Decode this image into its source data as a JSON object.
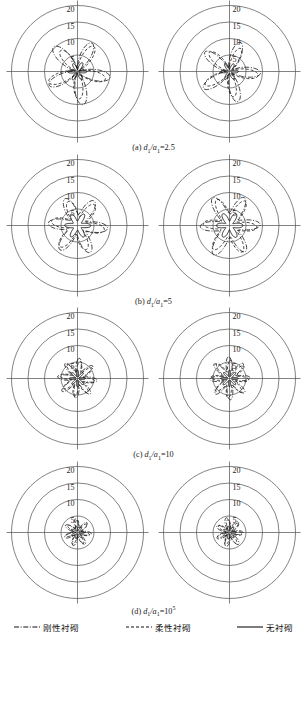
{
  "figure": {
    "title": "",
    "panel_count": 4,
    "plots_per_panel": 2,
    "grid_color": "#4d4d4d",
    "curve_color": "#111111"
  },
  "axis": {
    "tick_labels": [
      "5",
      "10",
      "15",
      "20"
    ],
    "tick_values": [
      5,
      10,
      15,
      20
    ],
    "rmax": 20,
    "rings": 4,
    "cross_axes": true
  },
  "legend": {
    "items": [
      {
        "label": "刚性衬砌",
        "style": "dash-dot",
        "name": "rigid-lining"
      },
      {
        "label": "柔性衬砌",
        "style": "dashed",
        "name": "flexible-lining"
      },
      {
        "label": "无衬砌",
        "style": "solid",
        "name": "no-lining"
      }
    ]
  },
  "panels": [
    {
      "id": "a",
      "caption_prefix": "(a) ",
      "caption_num": "d",
      "caption_sub1": "1",
      "caption_slash": "/a",
      "caption_sub2": "1",
      "caption_eq": "=2.5",
      "caption_sup": "",
      "label_side_left": "left",
      "label_side_right": "right"
    },
    {
      "id": "b",
      "caption_prefix": "(b) ",
      "caption_num": "d",
      "caption_sub1": "1",
      "caption_slash": "/a",
      "caption_sub2": "1",
      "caption_eq": "=5",
      "caption_sup": "",
      "label_side_left": "left",
      "label_side_right": "right"
    },
    {
      "id": "c",
      "caption_prefix": "(c) ",
      "caption_num": "d",
      "caption_sub1": "1",
      "caption_slash": "/a",
      "caption_sub2": "1",
      "caption_eq": "=10",
      "caption_sup": "",
      "label_side_left": "left",
      "label_side_right": "right"
    },
    {
      "id": "d",
      "caption_prefix": "(d) ",
      "caption_num": "d",
      "caption_sub1": "1",
      "caption_slash": "/a",
      "caption_sub2": "1",
      "caption_eq": "=10",
      "caption_sup": "5",
      "label_side_left": "left",
      "label_side_right": "right"
    }
  ],
  "chart_data": {
    "type": "line",
    "subtype": "polar-rose",
    "title": "",
    "xlabel": "",
    "ylabel": "",
    "rlim": [
      0,
      20
    ],
    "rticks": [
      5,
      10,
      15,
      20
    ],
    "grid": true,
    "legend_position": "bottom",
    "series_names": [
      "刚性衬砌",
      "柔性衬砌",
      "无衬砌"
    ],
    "plots": [
      {
        "panel": "a",
        "position": "left",
        "label_side": "left",
        "series": [
          {
            "name": "刚性衬砌",
            "style": "dash-dot",
            "lobes": 5,
            "r_mean": 5.2,
            "r_amp": 4.6,
            "phase_deg": 100,
            "rmax_observed": 9.8
          },
          {
            "name": "柔性衬砌",
            "style": "dashed",
            "lobes": 5,
            "r_mean": 4.6,
            "r_amp": 4.0,
            "phase_deg": 106,
            "rmax_observed": 8.6
          },
          {
            "name": "无衬砌",
            "style": "solid",
            "lobes": 6,
            "r_mean": 1.7,
            "r_amp": 1.2,
            "phase_deg": 90,
            "rmax_observed": 2.9
          }
        ]
      },
      {
        "panel": "a",
        "position": "right",
        "label_side": "right",
        "series": [
          {
            "name": "刚性衬砌",
            "style": "dash-dot",
            "lobes": 5,
            "r_mean": 4.9,
            "r_amp": 4.3,
            "phase_deg": 92,
            "rmax_observed": 9.2
          },
          {
            "name": "柔性衬砌",
            "style": "dashed",
            "lobes": 5,
            "r_mean": 4.3,
            "r_amp": 3.7,
            "phase_deg": 98,
            "rmax_observed": 8.0
          },
          {
            "name": "无衬砌",
            "style": "solid",
            "lobes": 6,
            "r_mean": 1.6,
            "r_amp": 1.1,
            "phase_deg": 90,
            "rmax_observed": 2.7
          }
        ]
      },
      {
        "panel": "b",
        "position": "left",
        "label_side": "left",
        "series": [
          {
            "name": "刚性衬砌",
            "style": "dash-dot",
            "lobes": 6,
            "r_mean": 6.0,
            "r_amp": 3.0,
            "phase_deg": 95,
            "rmax_observed": 9.0
          },
          {
            "name": "柔性衬砌",
            "style": "dashed",
            "lobes": 6,
            "r_mean": 5.4,
            "r_amp": 2.7,
            "phase_deg": 100,
            "rmax_observed": 8.1
          },
          {
            "name": "无衬砌",
            "style": "solid",
            "lobes": 6,
            "r_mean": 2.6,
            "r_amp": 1.3,
            "phase_deg": 90,
            "rmax_observed": 3.9
          }
        ]
      },
      {
        "panel": "b",
        "position": "right",
        "label_side": "right",
        "series": [
          {
            "name": "刚性衬砌",
            "style": "dash-dot",
            "lobes": 6,
            "r_mean": 6.2,
            "r_amp": 3.1,
            "phase_deg": 88,
            "rmax_observed": 9.3
          },
          {
            "name": "柔性衬砌",
            "style": "dashed",
            "lobes": 6,
            "r_mean": 5.6,
            "r_amp": 2.8,
            "phase_deg": 94,
            "rmax_observed": 8.4
          },
          {
            "name": "无衬砌",
            "style": "solid",
            "lobes": 6,
            "r_mean": 2.7,
            "r_amp": 1.4,
            "phase_deg": 90,
            "rmax_observed": 4.1
          }
        ]
      },
      {
        "panel": "c",
        "position": "left",
        "label_side": "left",
        "series": [
          {
            "name": "刚性衬砌",
            "style": "dash-dot",
            "lobes": 8,
            "r_mean": 4.0,
            "r_amp": 2.0,
            "phase_deg": 95,
            "rmax_observed": 6.0
          },
          {
            "name": "柔性衬砌",
            "style": "dashed",
            "lobes": 8,
            "r_mean": 3.6,
            "r_amp": 1.8,
            "phase_deg": 100,
            "rmax_observed": 5.4
          },
          {
            "name": "无衬砌",
            "style": "solid",
            "lobes": 8,
            "r_mean": 1.5,
            "r_amp": 1.0,
            "phase_deg": 90,
            "rmax_observed": 2.5
          }
        ]
      },
      {
        "panel": "c",
        "position": "right",
        "label_side": "right",
        "series": [
          {
            "name": "刚性衬砌",
            "style": "dash-dot",
            "lobes": 8,
            "r_mean": 4.2,
            "r_amp": 2.1,
            "phase_deg": 88,
            "rmax_observed": 6.3
          },
          {
            "name": "柔性衬砌",
            "style": "dashed",
            "lobes": 8,
            "r_mean": 3.8,
            "r_amp": 1.9,
            "phase_deg": 93,
            "rmax_observed": 5.7
          },
          {
            "name": "无衬砌",
            "style": "solid",
            "lobes": 8,
            "r_mean": 1.6,
            "r_amp": 1.0,
            "phase_deg": 90,
            "rmax_observed": 2.6
          }
        ]
      },
      {
        "panel": "d",
        "position": "left",
        "label_side": "left",
        "series": [
          {
            "name": "刚性衬砌",
            "style": "dash-dot",
            "lobes": 7,
            "r_mean": 2.7,
            "r_amp": 1.5,
            "phase_deg": 95,
            "rmax_observed": 4.2
          },
          {
            "name": "柔性衬砌",
            "style": "dashed",
            "lobes": 7,
            "r_mean": 2.4,
            "r_amp": 1.3,
            "phase_deg": 101,
            "rmax_observed": 3.7
          },
          {
            "name": "无衬砌",
            "style": "solid",
            "lobes": 7,
            "r_mean": 1.2,
            "r_amp": 0.8,
            "phase_deg": 90,
            "rmax_observed": 2.0
          }
        ]
      },
      {
        "panel": "d",
        "position": "right",
        "label_side": "right",
        "series": [
          {
            "name": "刚性衬砌",
            "style": "dash-dot",
            "lobes": 7,
            "r_mean": 2.8,
            "r_amp": 1.6,
            "phase_deg": 90,
            "rmax_observed": 4.4
          },
          {
            "name": "柔性衬砌",
            "style": "dashed",
            "lobes": 7,
            "r_mean": 2.5,
            "r_amp": 1.4,
            "phase_deg": 96,
            "rmax_observed": 3.9
          },
          {
            "name": "无衬砌",
            "style": "solid",
            "lobes": 7,
            "r_mean": 1.2,
            "r_amp": 0.8,
            "phase_deg": 90,
            "rmax_observed": 2.1
          }
        ]
      }
    ]
  }
}
